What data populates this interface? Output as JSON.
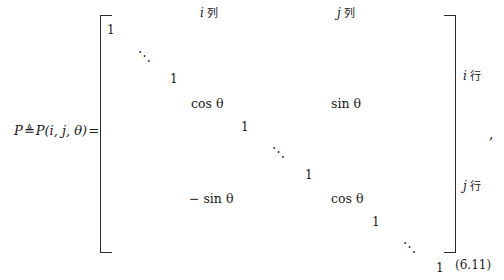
{
  "equation": {
    "lhs": {
      "symbol": "P",
      "relation": "≜",
      "definition": "P(i, j, θ)",
      "equals": "="
    },
    "number": "(6.11)",
    "trailing_punctuation": ","
  },
  "column_headers": [
    {
      "index": "i",
      "label": "列"
    },
    {
      "index": "j",
      "label": "列"
    }
  ],
  "row_labels": [
    {
      "index": "i",
      "label": "行"
    },
    {
      "index": "j",
      "label": "行"
    }
  ],
  "matrix": {
    "description": "Givens rotation matrix",
    "entries": [
      {
        "name": "one-top-1",
        "text": "1",
        "left": 7,
        "top": 8,
        "kind": "number"
      },
      {
        "name": "ddots-top",
        "text": "⋱",
        "left": 38,
        "top": 33,
        "kind": "dots"
      },
      {
        "name": "one-top-2",
        "text": "1",
        "left": 70,
        "top": 57,
        "kind": "number"
      },
      {
        "name": "cos-theta-ii",
        "text": "cos θ",
        "left": 91,
        "top": 81,
        "kind": "expression"
      },
      {
        "name": "sin-theta-ij",
        "text": "sin θ",
        "left": 231,
        "top": 81,
        "kind": "expression"
      },
      {
        "name": "one-mid-1",
        "text": "1",
        "left": 141,
        "top": 105,
        "kind": "number"
      },
      {
        "name": "ddots-mid",
        "text": "⋱",
        "left": 172,
        "top": 129,
        "kind": "dots"
      },
      {
        "name": "one-mid-2",
        "text": "1",
        "left": 205,
        "top": 153,
        "kind": "number"
      },
      {
        "name": "neg-sin-theta-ji",
        "text": "− sin θ",
        "left": 89,
        "top": 176,
        "kind": "expression"
      },
      {
        "name": "cos-theta-jj",
        "text": "cos θ",
        "left": 231,
        "top": 176,
        "kind": "expression"
      },
      {
        "name": "one-bot-1",
        "text": "1",
        "left": 272,
        "top": 200,
        "kind": "number"
      },
      {
        "name": "ddots-bot",
        "text": "⋱",
        "left": 303,
        "top": 224,
        "kind": "dots"
      },
      {
        "name": "one-bot-2",
        "text": "1",
        "left": 336,
        "top": 246,
        "kind": "number"
      }
    ]
  }
}
